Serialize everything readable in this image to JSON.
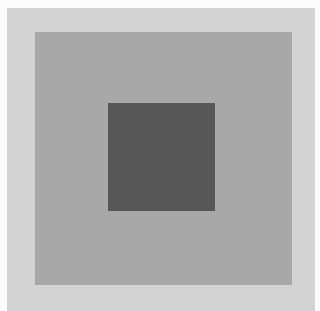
{
  "figure": {
    "width": 315,
    "height": 311,
    "colors": {
      "frame": "#fbfbfb",
      "background": "#d3d3d3",
      "middle_square": "#a8a8a8",
      "inner_square": "#575757"
    },
    "shapes": [
      {
        "name": "background-panel",
        "x": 7,
        "y": 8,
        "w": 308,
        "h": 303,
        "color": "#d3d3d3"
      },
      {
        "name": "middle-square",
        "x": 35,
        "y": 32,
        "w": 257,
        "h": 253,
        "color": "#a8a8a8"
      },
      {
        "name": "inner-square",
        "x": 108,
        "y": 103,
        "w": 107,
        "h": 108,
        "color": "#575757"
      }
    ]
  }
}
